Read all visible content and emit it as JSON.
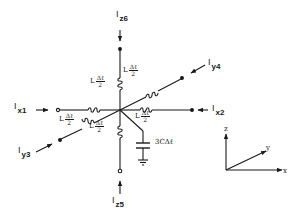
{
  "diagram": {
    "colors": {
      "ink": "#1a1a1a",
      "background": "#ffffff"
    },
    "currents": {
      "x1": {
        "symbol": "I",
        "sub": "x1"
      },
      "x2": {
        "symbol": "I",
        "sub": "x2"
      },
      "y3": {
        "symbol": "I",
        "sub": "y3"
      },
      "y4": {
        "symbol": "I",
        "sub": "y4"
      },
      "z5": {
        "symbol": "I",
        "sub": "z5"
      },
      "z6": {
        "symbol": "I",
        "sub": "z6"
      }
    },
    "inductor_label": {
      "prefix": "L",
      "numerator": "Δℓ",
      "denominator": "2"
    },
    "capacitor_label": "3CΔℓ",
    "axes": {
      "x": "x",
      "y": "y",
      "z": "z"
    }
  }
}
